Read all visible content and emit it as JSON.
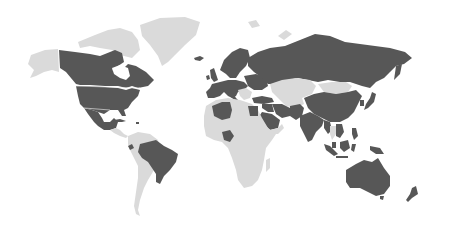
{
  "map": {
    "type": "choropleth-world",
    "projection": "equirectangular-ish (Antarctica omitted)",
    "colors": {
      "highlighted": "#575757",
      "not_highlighted": "#dadada",
      "background": "#ffffff"
    },
    "legend": null,
    "highlighted_regions": [
      "Canada",
      "United States",
      "Mexico",
      "Cuba",
      "Ecuador",
      "Brazil",
      "Iceland",
      "United Kingdom",
      "Ireland",
      "Norway",
      "Sweden",
      "Finland",
      "France",
      "Spain",
      "Portugal",
      "Germany",
      "Italy",
      "Poland",
      "Ukraine",
      "Belarus",
      "Baltic states",
      "Russia",
      "Turkey",
      "Iran",
      "Iraq",
      "Saudi Arabia",
      "Syria",
      "Pakistan",
      "Afghanistan",
      "India",
      "China",
      "Japan",
      "South Korea",
      "Myanmar",
      "Vietnam",
      "Malaysia",
      "Indonesia",
      "Philippines",
      "Papua New Guinea",
      "Algeria",
      "Egypt",
      "Nigeria",
      "Australia",
      "New Zealand"
    ],
    "non_highlighted_regions": [
      "Alaska",
      "Greenland",
      "Canadian Arctic Archipelago",
      "Central America",
      "Colombia",
      "Venezuela",
      "Peru",
      "Bolivia",
      "Argentina",
      "Chile",
      "Sub-Saharan Africa (most)",
      "Morocco",
      "Libya",
      "Kazakhstan",
      "Mongolia",
      "Thailand",
      "Madagascar",
      "Svalbard/Novaya Zemlya"
    ]
  }
}
